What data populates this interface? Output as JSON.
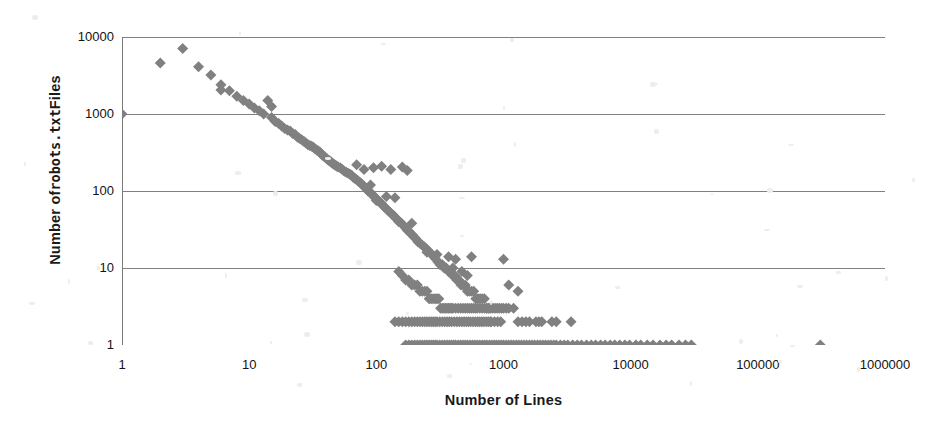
{
  "chart_data": {
    "type": "scatter",
    "title": "",
    "xlabel": "Number of Lines",
    "ylabel_prefix": "Number of ",
    "ylabel_mono": "robots.txt",
    "ylabel_suffix": " Files",
    "ylabel_full": "Number of robots.txt Files",
    "xscale": "log",
    "yscale": "log",
    "xlim": [
      1,
      1000000
    ],
    "ylim": [
      1,
      10000
    ],
    "xticks": [
      1,
      10,
      100,
      1000,
      10000,
      100000,
      1000000
    ],
    "xtick_labels": [
      "1",
      "10",
      "100",
      "1000",
      "10000",
      "100000",
      "1000000"
    ],
    "yticks": [
      1,
      10,
      100,
      1000,
      10000
    ],
    "ytick_labels": [
      "1",
      "10",
      "100",
      "1000",
      "10000"
    ],
    "grid": "horizontal",
    "legend": "none",
    "marker": "diamond",
    "marker_color": "#808080",
    "marker_size": 9,
    "gridline_color": "#808080",
    "axis_color": "#7a7a7a",
    "background": "#ffffff",
    "points": [
      [
        1,
        1000
      ],
      [
        2,
        4600
      ],
      [
        3,
        7100
      ],
      [
        4,
        4100
      ],
      [
        5,
        3200
      ],
      [
        6,
        2400
      ],
      [
        6,
        2050
      ],
      [
        7,
        2000
      ],
      [
        8,
        1700
      ],
      [
        9,
        1500
      ],
      [
        10,
        1350
      ],
      [
        11,
        1200
      ],
      [
        12,
        1100
      ],
      [
        13,
        1000
      ],
      [
        14,
        1500
      ],
      [
        15,
        1250
      ],
      [
        15,
        900
      ],
      [
        16,
        800
      ],
      [
        17,
        760
      ],
      [
        18,
        700
      ],
      [
        19,
        650
      ],
      [
        20,
        620
      ],
      [
        21,
        600
      ],
      [
        22,
        560
      ],
      [
        23,
        540
      ],
      [
        24,
        500
      ],
      [
        25,
        480
      ],
      [
        26,
        460
      ],
      [
        27,
        440
      ],
      [
        28,
        420
      ],
      [
        29,
        400
      ],
      [
        30,
        390
      ],
      [
        31,
        380
      ],
      [
        32,
        370
      ],
      [
        33,
        350
      ],
      [
        34,
        340
      ],
      [
        35,
        330
      ],
      [
        36,
        320
      ],
      [
        37,
        300
      ],
      [
        38,
        290
      ],
      [
        39,
        280
      ],
      [
        40,
        270
      ],
      [
        41,
        260
      ],
      [
        42,
        250
      ],
      [
        43,
        245
      ],
      [
        44,
        240
      ],
      [
        45,
        230
      ],
      [
        46,
        225
      ],
      [
        47,
        220
      ],
      [
        48,
        215
      ],
      [
        49,
        210
      ],
      [
        50,
        205
      ],
      [
        52,
        200
      ],
      [
        54,
        190
      ],
      [
        56,
        180
      ],
      [
        58,
        175
      ],
      [
        60,
        170
      ],
      [
        62,
        165
      ],
      [
        64,
        160
      ],
      [
        66,
        150
      ],
      [
        68,
        145
      ],
      [
        70,
        140
      ],
      [
        72,
        135
      ],
      [
        74,
        130
      ],
      [
        76,
        125
      ],
      [
        78,
        120
      ],
      [
        80,
        115
      ],
      [
        82,
        110
      ],
      [
        84,
        105
      ],
      [
        86,
        100
      ],
      [
        88,
        98
      ],
      [
        90,
        95
      ],
      [
        92,
        92
      ],
      [
        94,
        88
      ],
      [
        96,
        85
      ],
      [
        98,
        82
      ],
      [
        100,
        80
      ],
      [
        103,
        76
      ],
      [
        106,
        72
      ],
      [
        109,
        70
      ],
      [
        112,
        66
      ],
      [
        115,
        63
      ],
      [
        118,
        60
      ],
      [
        121,
        58
      ],
      [
        125,
        55
      ],
      [
        129,
        52
      ],
      [
        133,
        50
      ],
      [
        137,
        48
      ],
      [
        141,
        45
      ],
      [
        145,
        43
      ],
      [
        150,
        41
      ],
      [
        155,
        39
      ],
      [
        160,
        37
      ],
      [
        165,
        35
      ],
      [
        170,
        33
      ],
      [
        175,
        31
      ],
      [
        180,
        30
      ],
      [
        186,
        28
      ],
      [
        192,
        27
      ],
      [
        198,
        25
      ],
      [
        205,
        24
      ],
      [
        212,
        22
      ],
      [
        220,
        21
      ],
      [
        228,
        20
      ],
      [
        236,
        19
      ],
      [
        245,
        18
      ],
      [
        254,
        17
      ],
      [
        263,
        16
      ],
      [
        273,
        15
      ],
      [
        283,
        14
      ],
      [
        294,
        13
      ],
      [
        305,
        12
      ],
      [
        317,
        11
      ],
      [
        329,
        11
      ],
      [
        342,
        10
      ],
      [
        355,
        10
      ],
      [
        369,
        9
      ],
      [
        383,
        9
      ],
      [
        398,
        8
      ],
      [
        413,
        8
      ],
      [
        429,
        7
      ],
      [
        446,
        7
      ],
      [
        463,
        6
      ],
      [
        481,
        6
      ],
      [
        500,
        6
      ],
      [
        520,
        5
      ],
      [
        540,
        5
      ],
      [
        561,
        5
      ],
      [
        583,
        5
      ],
      [
        606,
        4
      ],
      [
        630,
        4
      ],
      [
        654,
        4
      ],
      [
        680,
        4
      ],
      [
        707,
        4
      ],
      [
        735,
        3
      ],
      [
        764,
        3
      ],
      [
        794,
        3
      ],
      [
        825,
        3
      ],
      [
        858,
        3
      ],
      [
        891,
        3
      ],
      [
        926,
        3
      ],
      [
        963,
        3
      ],
      [
        1000,
        3
      ],
      [
        70,
        220
      ],
      [
        80,
        190
      ],
      [
        90,
        120
      ],
      [
        95,
        200
      ],
      [
        100,
        75
      ],
      [
        110,
        210
      ],
      [
        130,
        190
      ],
      [
        160,
        205
      ],
      [
        175,
        185
      ],
      [
        120,
        85
      ],
      [
        140,
        82
      ],
      [
        150,
        40
      ],
      [
        190,
        38
      ],
      [
        250,
        16
      ],
      [
        300,
        15
      ],
      [
        370,
        14
      ],
      [
        420,
        13
      ],
      [
        560,
        14
      ],
      [
        1000,
        13
      ],
      [
        330,
        11
      ],
      [
        400,
        10
      ],
      [
        470,
        9
      ],
      [
        520,
        8
      ],
      [
        150,
        9
      ],
      [
        160,
        8
      ],
      [
        170,
        7
      ],
      [
        180,
        7
      ],
      [
        190,
        6
      ],
      [
        200,
        6
      ],
      [
        210,
        6
      ],
      [
        220,
        5
      ],
      [
        230,
        5
      ],
      [
        240,
        5
      ],
      [
        250,
        5
      ],
      [
        260,
        4
      ],
      [
        270,
        4
      ],
      [
        280,
        4
      ],
      [
        290,
        4
      ],
      [
        300,
        4
      ],
      [
        310,
        4
      ],
      [
        320,
        3
      ],
      [
        330,
        3
      ],
      [
        340,
        3
      ],
      [
        350,
        3
      ],
      [
        360,
        3
      ],
      [
        370,
        3
      ],
      [
        380,
        3
      ],
      [
        390,
        3
      ],
      [
        400,
        3
      ],
      [
        420,
        3
      ],
      [
        440,
        3
      ],
      [
        460,
        3
      ],
      [
        480,
        3
      ],
      [
        500,
        3
      ],
      [
        520,
        3
      ],
      [
        540,
        3
      ],
      [
        560,
        3
      ],
      [
        580,
        3
      ],
      [
        600,
        3
      ],
      [
        620,
        3
      ],
      [
        650,
        3
      ],
      [
        680,
        3
      ],
      [
        710,
        3
      ],
      [
        740,
        3
      ],
      [
        770,
        3
      ],
      [
        800,
        2
      ],
      [
        850,
        2
      ],
      [
        900,
        2
      ],
      [
        950,
        2
      ],
      [
        1050,
        3
      ],
      [
        1100,
        3
      ],
      [
        1200,
        3
      ],
      [
        1300,
        2
      ],
      [
        1400,
        2
      ],
      [
        1600,
        2
      ],
      [
        1800,
        2
      ],
      [
        2000,
        2
      ],
      [
        2400,
        2
      ],
      [
        140,
        2
      ],
      [
        150,
        2
      ],
      [
        160,
        2
      ],
      [
        170,
        2
      ],
      [
        180,
        2
      ],
      [
        190,
        2
      ],
      [
        200,
        2
      ],
      [
        210,
        2
      ],
      [
        220,
        2
      ],
      [
        230,
        2
      ],
      [
        240,
        2
      ],
      [
        250,
        2
      ],
      [
        260,
        2
      ],
      [
        270,
        2
      ],
      [
        280,
        2
      ],
      [
        290,
        2
      ],
      [
        300,
        2
      ],
      [
        315,
        2
      ],
      [
        330,
        2
      ],
      [
        345,
        2
      ],
      [
        360,
        2
      ],
      [
        375,
        2
      ],
      [
        390,
        2
      ],
      [
        410,
        2
      ],
      [
        430,
        2
      ],
      [
        450,
        2
      ],
      [
        470,
        2
      ],
      [
        490,
        2
      ],
      [
        510,
        2
      ],
      [
        530,
        2
      ],
      [
        550,
        2
      ],
      [
        575,
        2
      ],
      [
        600,
        2
      ],
      [
        625,
        2
      ],
      [
        650,
        2
      ],
      [
        675,
        2
      ],
      [
        700,
        2
      ],
      [
        730,
        2
      ],
      [
        760,
        2
      ],
      [
        790,
        2
      ],
      [
        170,
        1
      ],
      [
        180,
        1
      ],
      [
        190,
        1
      ],
      [
        200,
        1
      ],
      [
        210,
        1
      ],
      [
        220,
        1
      ],
      [
        230,
        1
      ],
      [
        240,
        1
      ],
      [
        250,
        1
      ],
      [
        260,
        1
      ],
      [
        270,
        1
      ],
      [
        280,
        1
      ],
      [
        290,
        1
      ],
      [
        300,
        1
      ],
      [
        315,
        1
      ],
      [
        330,
        1
      ],
      [
        345,
        1
      ],
      [
        360,
        1
      ],
      [
        375,
        1
      ],
      [
        390,
        1
      ],
      [
        405,
        1
      ],
      [
        420,
        1
      ],
      [
        440,
        1
      ],
      [
        460,
        1
      ],
      [
        480,
        1
      ],
      [
        500,
        1
      ],
      [
        520,
        1
      ],
      [
        545,
        1
      ],
      [
        570,
        1
      ],
      [
        595,
        1
      ],
      [
        620,
        1
      ],
      [
        650,
        1
      ],
      [
        680,
        1
      ],
      [
        710,
        1
      ],
      [
        740,
        1
      ],
      [
        775,
        1
      ],
      [
        810,
        1
      ],
      [
        845,
        1
      ],
      [
        880,
        1
      ],
      [
        920,
        1
      ],
      [
        960,
        1
      ],
      [
        1000,
        1
      ],
      [
        1050,
        1
      ],
      [
        1100,
        1
      ],
      [
        1150,
        1
      ],
      [
        1200,
        1
      ],
      [
        1260,
        1
      ],
      [
        1320,
        1
      ],
      [
        1380,
        1
      ],
      [
        1450,
        1
      ],
      [
        1520,
        1
      ],
      [
        1600,
        1
      ],
      [
        1680,
        1
      ],
      [
        1760,
        1
      ],
      [
        1850,
        1
      ],
      [
        1940,
        1
      ],
      [
        2040,
        1
      ],
      [
        2140,
        1
      ],
      [
        2250,
        1
      ],
      [
        2360,
        1
      ],
      [
        2480,
        1
      ],
      [
        2600,
        1
      ],
      [
        2800,
        1
      ],
      [
        3000,
        1
      ],
      [
        3200,
        1
      ],
      [
        3500,
        1
      ],
      [
        3800,
        1
      ],
      [
        4100,
        1
      ],
      [
        4500,
        1
      ],
      [
        4900,
        1
      ],
      [
        5300,
        1
      ],
      [
        5800,
        1
      ],
      [
        6300,
        1
      ],
      [
        6900,
        1
      ],
      [
        7500,
        1
      ],
      [
        8200,
        1
      ],
      [
        9000,
        1
      ],
      [
        9800,
        1
      ],
      [
        11000,
        1
      ],
      [
        12000,
        1
      ],
      [
        13500,
        1
      ],
      [
        15000,
        1
      ],
      [
        17000,
        1
      ],
      [
        19000,
        1
      ],
      [
        21000,
        1
      ],
      [
        24000,
        1
      ],
      [
        27000,
        1
      ],
      [
        30000,
        1
      ],
      [
        310000,
        1
      ],
      [
        1100,
        6
      ],
      [
        1300,
        5
      ],
      [
        1500,
        2
      ],
      [
        1900,
        2
      ],
      [
        2600,
        2
      ],
      [
        3400,
        2
      ]
    ]
  }
}
